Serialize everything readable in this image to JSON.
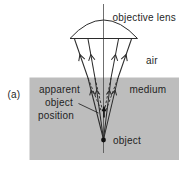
{
  "figure": {
    "panel_label": "(a)",
    "labels": {
      "objective_lens": "objective lens",
      "air": "air",
      "medium": "medium",
      "apparent_position_line1": "apparent",
      "apparent_position_line2": "object",
      "apparent_position_line3": "position",
      "object": "object"
    },
    "colors": {
      "medium_fill": "#bdbdbd",
      "ink": "#2b2b2b",
      "background": "#ffffff"
    }
  }
}
